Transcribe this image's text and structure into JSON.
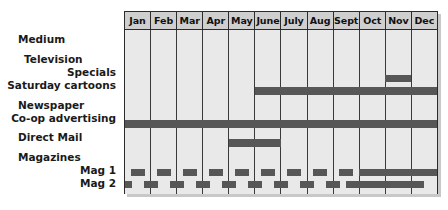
{
  "chart_data": {
    "type": "bar",
    "title": "",
    "xlabel": "",
    "ylabel": "Medium",
    "grid": true,
    "legend": "none",
    "categories": [
      "Jan",
      "Feb",
      "Mar",
      "Apr",
      "May",
      "June",
      "July",
      "Aug",
      "Sept",
      "Oct",
      "Nov",
      "Dec"
    ],
    "row_header": "Medium",
    "rows": [
      {
        "label": "Television",
        "level": 1,
        "type": "group",
        "spans": []
      },
      {
        "label": "Specials",
        "level": 2,
        "type": "schedule",
        "spans": [
          {
            "start": "Nov",
            "end": "Nov"
          }
        ]
      },
      {
        "label": "Saturday cartoons",
        "level": 2,
        "type": "schedule",
        "spans": [
          {
            "start": "June",
            "end": "Dec"
          }
        ]
      },
      {
        "label": "Newspaper",
        "level": 1,
        "type": "group",
        "spans": []
      },
      {
        "label": "Co-op advertising",
        "level": 2,
        "type": "schedule",
        "spans": [
          {
            "start": "Jan",
            "end": "Dec"
          }
        ]
      },
      {
        "label": "Direct Mail",
        "level": 1,
        "type": "schedule",
        "spans": [
          {
            "start": "May",
            "end": "June"
          }
        ]
      },
      {
        "label": "Magazines",
        "level": 1,
        "type": "group",
        "spans": []
      },
      {
        "label": "Mag 1",
        "level": 2,
        "type": "schedule",
        "spans": [
          {
            "start": "Jan",
            "end": "Jan"
          },
          {
            "start": "Feb",
            "end": "Feb"
          },
          {
            "start": "Mar",
            "end": "Mar"
          },
          {
            "start": "Apr",
            "end": "Apr"
          },
          {
            "start": "May",
            "end": "May"
          },
          {
            "start": "June",
            "end": "June"
          },
          {
            "start": "July",
            "end": "July"
          },
          {
            "start": "Aug",
            "end": "Aug"
          },
          {
            "start": "Sept",
            "end": "Sept"
          },
          {
            "start": "Oct",
            "end": "Dec"
          }
        ]
      },
      {
        "label": "Mag 2",
        "level": 2,
        "type": "schedule",
        "spans": [
          {
            "start": "Jan",
            "end": "Jan"
          },
          {
            "start": "Feb",
            "end": "Feb"
          },
          {
            "start": "Mar",
            "end": "Mar"
          },
          {
            "start": "Apr",
            "end": "Apr"
          },
          {
            "start": "May",
            "end": "May"
          },
          {
            "start": "June",
            "end": "June"
          },
          {
            "start": "July",
            "end": "July"
          },
          {
            "start": "Aug",
            "end": "Aug"
          },
          {
            "start": "Sept",
            "end": "Sept"
          },
          {
            "start": "Oct",
            "end": "Dec"
          }
        ]
      }
    ]
  },
  "labels": {
    "medium": "Medium",
    "television": "Television",
    "specials": "Specials",
    "saturday_cartoons": "Saturday cartoons",
    "newspaper": "Newspaper",
    "coop_advertising": "Co-op advertising",
    "direct_mail": "Direct Mail",
    "magazines": "Magazines",
    "mag1": "Mag 1",
    "mag2": "Mag 2"
  },
  "months": {
    "jan": "Jan",
    "feb": "Feb",
    "mar": "Mar",
    "apr": "Apr",
    "may": "May",
    "june": "June",
    "july": "July",
    "aug": "Aug",
    "sept": "Sept",
    "oct": "Oct",
    "nov": "Nov",
    "dec": "Dec"
  },
  "colors": {
    "bar": "#575757",
    "grid_fill": "#e9e9e9",
    "header_fill": "#cfcfcf",
    "border": "#2b2b2b",
    "text": "#1a1a1a"
  }
}
